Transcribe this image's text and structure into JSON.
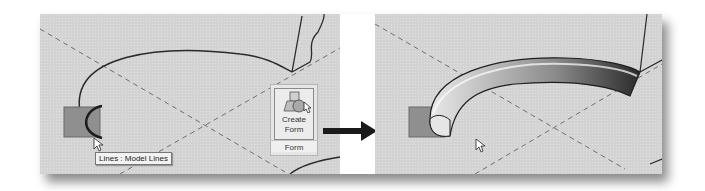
{
  "left_view": {
    "tooltip": "Lines : Model Lines",
    "ribbon": {
      "button_label_line1": "Create",
      "button_label_line2": "Form",
      "panel_label": "Form",
      "button_icon": "create-form-icon"
    }
  },
  "right_view": {
    "result": "swept-form"
  },
  "colors": {
    "canvas": "#d3d3d3",
    "profile_square": "#8f8f8f",
    "line": "#2a2a2a",
    "arrow": "#1a1a1a"
  }
}
